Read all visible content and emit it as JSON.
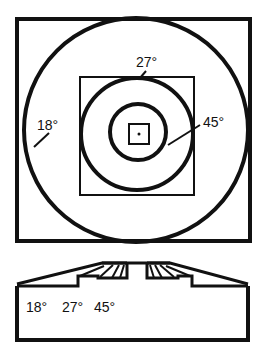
{
  "diagram": {
    "top_view": {
      "labels": {
        "outer_ring": "18°",
        "middle_ring": "27°",
        "inner_ring": "45°"
      }
    },
    "cross_section": {
      "labels": [
        "18°",
        "27°",
        "45°"
      ]
    }
  },
  "colors": {
    "stroke": "#111111",
    "background": "#ffffff"
  }
}
